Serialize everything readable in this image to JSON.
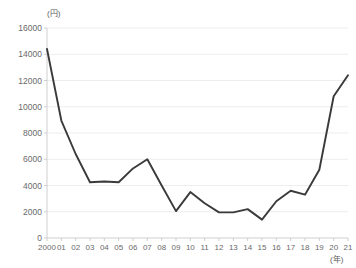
{
  "chart_data": {
    "type": "line",
    "title": "",
    "subtitle": "",
    "xlabel": "(年)",
    "ylabel": "(円)",
    "x_unit": "(年)",
    "y_unit": "(円)",
    "grid": true,
    "legend": "none",
    "line_color": "#3a3a3a",
    "grid_color": "#ededed",
    "axis_color": "#cfcfcf",
    "tick_text_color": "#6a6a6a",
    "ylim": [
      0,
      16000
    ],
    "ytick_values": [
      0,
      2000,
      4000,
      6000,
      8000,
      10000,
      12000,
      14000,
      16000
    ],
    "ytick_labels": [
      "0",
      "2000",
      "4000",
      "6000",
      "8000",
      "10000",
      "12000",
      "14000",
      "16000"
    ],
    "categories": [
      "2000",
      "01",
      "02",
      "03",
      "04",
      "05",
      "06",
      "07",
      "08",
      "09",
      "10",
      "11",
      "12",
      "13",
      "14",
      "15",
      "16",
      "17",
      "18",
      "19",
      "20",
      "21"
    ],
    "values": [
      14400,
      8950,
      6400,
      4250,
      4300,
      4250,
      5300,
      6000,
      4000,
      2050,
      3500,
      2650,
      1950,
      1950,
      2200,
      1400,
      2800,
      3600,
      3300,
      5200,
      10800,
      12400
    ]
  }
}
